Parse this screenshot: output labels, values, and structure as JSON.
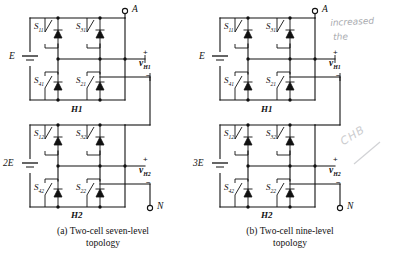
{
  "figure": {
    "panels": [
      {
        "id": "a",
        "caption_label": "(a)",
        "caption_line1": "Two-cell seven-level",
        "caption_line2": "topology",
        "terminal_top": "A",
        "terminal_bottom": "N",
        "cells": [
          {
            "name": "H1",
            "source": "E",
            "output_voltage": "v",
            "output_voltage_sub": "H1",
            "polarity_plus": "+",
            "polarity_minus": "−",
            "switches": [
              {
                "label": "S",
                "sub": "11",
                "position": "top-left"
              },
              {
                "label": "S",
                "sub": "31",
                "position": "top-right"
              },
              {
                "label": "S",
                "sub": "41",
                "position": "bottom-left"
              },
              {
                "label": "S",
                "sub": "21",
                "position": "bottom-right"
              }
            ]
          },
          {
            "name": "H2",
            "source": "2E",
            "output_voltage": "v",
            "output_voltage_sub": "H2",
            "polarity_plus": "+",
            "polarity_minus": "−",
            "switches": [
              {
                "label": "S",
                "sub": "12",
                "position": "top-left"
              },
              {
                "label": "S",
                "sub": "32",
                "position": "top-right"
              },
              {
                "label": "S",
                "sub": "42",
                "position": "bottom-left"
              },
              {
                "label": "S",
                "sub": "22",
                "position": "bottom-right"
              }
            ]
          }
        ]
      },
      {
        "id": "b",
        "caption_label": "(b)",
        "caption_line1": "Two-cell nine-level",
        "caption_line2": "topology",
        "terminal_top": "A",
        "terminal_bottom": "N",
        "cells": [
          {
            "name": "H1",
            "source": "E",
            "output_voltage": "v",
            "output_voltage_sub": "H1",
            "polarity_plus": "+",
            "polarity_minus": "−",
            "switches": [
              {
                "label": "S",
                "sub": "11",
                "position": "top-left"
              },
              {
                "label": "S",
                "sub": "31",
                "position": "top-right"
              },
              {
                "label": "S",
                "sub": "41",
                "position": "bottom-left"
              },
              {
                "label": "S",
                "sub": "21",
                "position": "bottom-right"
              }
            ]
          },
          {
            "name": "H2",
            "source": "3E",
            "output_voltage": "v",
            "output_voltage_sub": "H2",
            "polarity_plus": "+",
            "polarity_minus": "−",
            "switches": [
              {
                "label": "S",
                "sub": "12",
                "position": "top-left"
              },
              {
                "label": "S",
                "sub": "32",
                "position": "top-right"
              },
              {
                "label": "S",
                "sub": "42",
                "position": "bottom-left"
              },
              {
                "label": "S",
                "sub": "22",
                "position": "bottom-right"
              }
            ]
          }
        ]
      }
    ],
    "annotations": [
      {
        "id": "note-1",
        "text": "increased"
      },
      {
        "id": "note-2",
        "text": "the"
      },
      {
        "id": "note-3",
        "text": "CHB"
      }
    ]
  },
  "colors": {
    "ink": "#111111",
    "paper": "#ffffff",
    "pencil": "#8d8f95"
  }
}
